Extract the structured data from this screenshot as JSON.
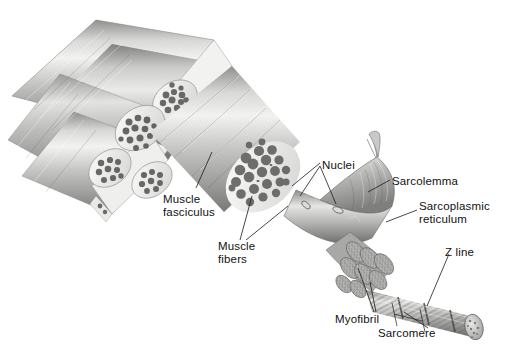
{
  "figure": {
    "background_color": "#ffffff",
    "width": 509,
    "height": 354,
    "style": "grayscale airbrush anatomical illustration",
    "text_color": "#111111"
  },
  "labels": [
    {
      "id": "muscle-fasciculus",
      "text": "Muscle\nfasciculus",
      "x": 163,
      "y": 193,
      "align": "left"
    },
    {
      "id": "muscle-fibers",
      "text": "Muscle\nfibers",
      "x": 218,
      "y": 240,
      "align": "left"
    },
    {
      "id": "nuclei",
      "text": "Nuclei",
      "x": 322,
      "y": 159,
      "align": "left"
    },
    {
      "id": "sarcolemma",
      "text": "Sarcolemma",
      "x": 392,
      "y": 175,
      "align": "left"
    },
    {
      "id": "sarcoplasmic-reticulum",
      "text": "Sarcoplasmic\nreticulum",
      "x": 419,
      "y": 200,
      "align": "left"
    },
    {
      "id": "z-line",
      "text": "Z line",
      "x": 445,
      "y": 246,
      "align": "left"
    },
    {
      "id": "myofibril",
      "text": "Myofibril",
      "x": 335,
      "y": 313,
      "align": "left"
    },
    {
      "id": "sarcomere",
      "text": "Sarcomere",
      "x": 378,
      "y": 327,
      "align": "left"
    }
  ],
  "structures": [
    {
      "id": "muscle-fascicle-bundle",
      "description": "Bundle of striated muscle fascicles tapering to upper left"
    },
    {
      "id": "fascicle-cross-section-cluster",
      "description": "Cut faces of four small fascicles showing packed polygonal muscle fibers"
    },
    {
      "id": "main-fascicle",
      "description": "Large central fascicle with cut face showing round muscle fibers"
    },
    {
      "id": "muscle-fiber",
      "description": "Single muscle fiber peeled out showing sarcolemma and nuclei"
    },
    {
      "id": "sarcoplasmic-reticulum-network",
      "description": "Tubular network wrapping the myofibrils"
    },
    {
      "id": "myofibril-bundle",
      "description": "Bundle of granular cylindrical myofibrils"
    },
    {
      "id": "single-myofibril",
      "description": "Single striated myofibril showing repeating sarcomeres and Z lines"
    }
  ],
  "colors": {
    "ink": "#111111",
    "leader": "#1a1a1a",
    "tissue_light": "#f2f2f0",
    "tissue_mid": "#b9b9b7",
    "tissue_dark": "#6e6e6c",
    "fiber_dark": "#5a5a58",
    "highlight": "#ffffff"
  }
}
